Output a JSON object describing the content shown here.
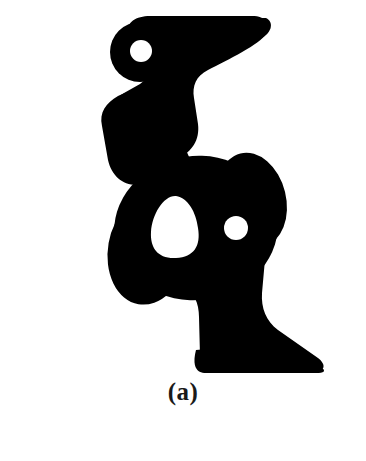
{
  "figure": {
    "caption": "(a)",
    "kind": "binary-shape-image",
    "background_color": "#ffffff",
    "foreground_color": "#000000",
    "blur_px": 5,
    "canvas": {
      "width": 366,
      "height": 461
    },
    "image_region": {
      "x": 95,
      "y": 18,
      "width": 230,
      "height": 354
    },
    "shape": {
      "name": "structural-blob",
      "outline_path": "M 150 20 L 262 20 C 268 26 266 34 258 40 L 206 62 C 196 68 192 78 193 90 L 196 126 C 197 140 190 150 178 156 L 158 166 C 146 172 140 180 138 192 L 133 214 C 130 228 134 240 146 248 L 178 268 C 190 276 196 286 197 300 L 200 352 C 201 364 206 370 216 372 L 318 372 C 324 372 326 368 322 362 L 272 330 C 262 322 258 310 259 296 L 262 250 C 264 232 258 216 244 204 L 214 180 C 200 168 182 164 166 168 L 140 176 C 126 180 116 176 112 164 L 106 140 C 102 124 108 110 122 102 L 146 88 C 158 80 162 68 158 54 L 150 34 Z",
      "holes": [
        {
          "name": "hole-top",
          "shape": "circle",
          "cx": 141,
          "cy": 51,
          "r": 11
        },
        {
          "name": "hole-center-triangular",
          "shape": "triangle-rounded",
          "cx": 176,
          "cy": 226,
          "rx": 26,
          "ry": 31
        },
        {
          "name": "hole-right-small",
          "shape": "circle",
          "cx": 236,
          "cy": 228,
          "r": 12
        }
      ]
    }
  }
}
